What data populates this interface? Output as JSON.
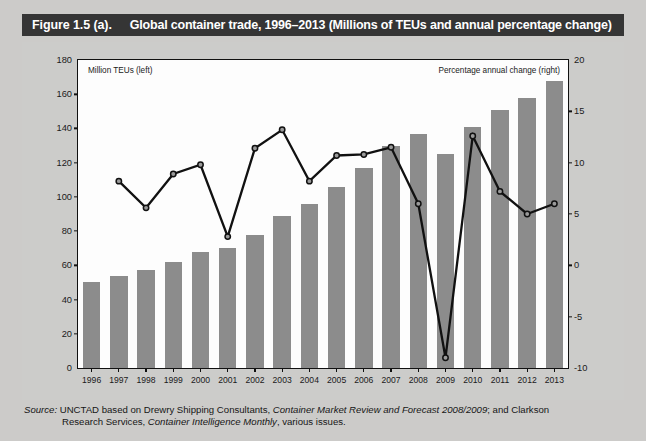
{
  "figure": {
    "number_label": "Figure 1.5 (a).",
    "title": "Global container trade, 1996–2013 (Millions of TEUs and annual percentage change)"
  },
  "annotations": {
    "left_axis_note": "Million TEUs (left)",
    "right_axis_note": "Percentage annual change (right)"
  },
  "source": {
    "label": "Source:",
    "line1_a": "UNCTAD based on Drewry Shipping Consultants, ",
    "line1_italic": "Container Market Review and Forecast 2008/2009",
    "line1_b": "; and Clarkson",
    "line2_a": "Research Services, ",
    "line2_italic": "Container Intelligence Monthly",
    "line2_b": ", various issues."
  },
  "colors": {
    "bar": "#8c8c8c",
    "line": "#111111",
    "title_bar_bg": "#353535",
    "title_bar_text": "#ffffff",
    "page_bg": "#ccccca",
    "plot_bg": "#fdfdfd"
  },
  "chart_data": {
    "type": "bar",
    "title": "Global container trade, 1996–2013 (Millions of TEUs and annual percentage change)",
    "xlabel": "",
    "ylabel": "Million TEUs (left)",
    "y2label": "Percentage annual change (right)",
    "categories": [
      "1996",
      "1997",
      "1998",
      "1999",
      "2000",
      "2001",
      "2002",
      "2003",
      "2004",
      "2005",
      "2006",
      "2007",
      "2008",
      "2009",
      "2010",
      "2011",
      "2012",
      "2013"
    ],
    "ylim": [
      0,
      180
    ],
    "yticks": [
      0,
      20,
      40,
      60,
      80,
      100,
      120,
      140,
      160,
      180
    ],
    "y2lim": [
      -10,
      20
    ],
    "y2ticks": [
      -10,
      -5,
      0,
      5,
      10,
      15,
      20
    ],
    "grid": false,
    "legend": "none",
    "series": [
      {
        "name": "Million TEUs (left)",
        "type": "bar",
        "axis": "left",
        "values": [
          50,
          54,
          57,
          62,
          68,
          70,
          78,
          89,
          96,
          106,
          117,
          130,
          137,
          125,
          141,
          151,
          158,
          168
        ]
      },
      {
        "name": "Percentage annual change (right)",
        "type": "line",
        "axis": "right",
        "values": [
          null,
          8.2,
          5.6,
          8.9,
          9.8,
          2.8,
          11.4,
          13.2,
          8.2,
          10.7,
          10.8,
          11.5,
          6.0,
          -9.0,
          12.6,
          7.2,
          5.0,
          6.0
        ]
      }
    ]
  }
}
